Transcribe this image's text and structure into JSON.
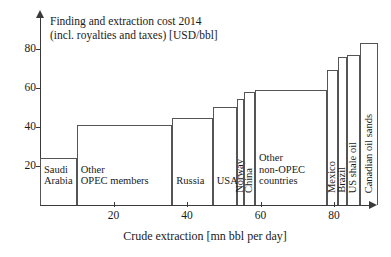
{
  "chart_data": {
    "type": "bar",
    "title": "Finding and extraction cost 2014\n(incl. royalties and taxes) [USD/bbl]",
    "xlabel": "Crude extraction [mn bbl per day]",
    "ylabel": "",
    "xlim": [
      0,
      92
    ],
    "ylim": [
      0,
      88
    ],
    "xticks": [
      20,
      40,
      60,
      80
    ],
    "yticks": [
      20,
      40,
      60,
      80
    ],
    "grid": false,
    "legend": false,
    "note": "Variable-width (Marimekko / cost-curve) bar chart: bar width = crude extraction volume, bar height = finding and extraction cost.",
    "bars": [
      {
        "label": "Saudi\nArabia",
        "x_start": 0,
        "x_end": 10,
        "width": 10,
        "value": 24,
        "label_orientation": "horizontal"
      },
      {
        "label": "Other\nOPEC members",
        "x_start": 10,
        "x_end": 36,
        "width": 26,
        "value": 41,
        "label_orientation": "horizontal"
      },
      {
        "label": "Russia",
        "x_start": 36,
        "x_end": 47,
        "width": 11,
        "value": 44.5,
        "label_orientation": "horizontal"
      },
      {
        "label": "USA",
        "x_start": 47,
        "x_end": 53.5,
        "width": 6.5,
        "value": 50.5,
        "label_orientation": "horizontal"
      },
      {
        "label": "Norway",
        "x_start": 53.5,
        "x_end": 55.5,
        "width": 2,
        "value": 54.5,
        "label_orientation": "vertical"
      },
      {
        "label": "China",
        "x_start": 55.5,
        "x_end": 58.5,
        "width": 3,
        "value": 58,
        "label_orientation": "vertical"
      },
      {
        "label": "Other\nnon-OPEC\ncountries",
        "x_start": 58.5,
        "x_end": 78,
        "width": 19.5,
        "value": 59,
        "label_orientation": "horizontal"
      },
      {
        "label": "Mexico",
        "x_start": 78,
        "x_end": 81,
        "width": 3,
        "value": 69,
        "label_orientation": "vertical"
      },
      {
        "label": "Brazil",
        "x_start": 81,
        "x_end": 83.5,
        "width": 2.5,
        "value": 76,
        "label_orientation": "vertical"
      },
      {
        "label": "US shale oil",
        "x_start": 83.5,
        "x_end": 87,
        "width": 3.5,
        "value": 77,
        "label_orientation": "vertical"
      },
      {
        "label": "Canadian oil sands",
        "x_start": 87,
        "x_end": 92,
        "width": 5,
        "value": 83,
        "label_orientation": "vertical"
      }
    ]
  },
  "colors": {
    "axis": "#3a3a3a",
    "bar_stroke": "#555555",
    "bar_fill": "transparent",
    "text": "#1a1a1a",
    "background": "#ffffff"
  }
}
